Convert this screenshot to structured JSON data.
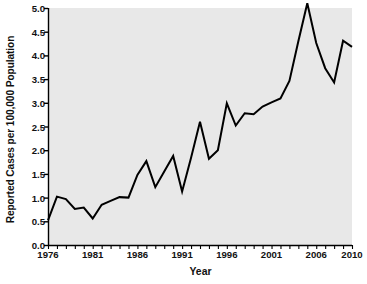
{
  "chart_data": {
    "type": "line",
    "title": "",
    "xlabel": "Year",
    "ylabel": "Reported Cases per 100,000 Population",
    "xlim": [
      1976,
      2010
    ],
    "ylim": [
      0.0,
      5.0
    ],
    "grid": false,
    "legend": null,
    "plot_background": "#e8e8e8",
    "line_color": "#000000",
    "axis_color": "#000000",
    "x": [
      1976,
      1977,
      1978,
      1979,
      1980,
      1981,
      1982,
      1983,
      1984,
      1985,
      1986,
      1987,
      1988,
      1989,
      1990,
      1991,
      1992,
      1993,
      1994,
      1995,
      1996,
      1997,
      1998,
      1999,
      2000,
      2001,
      2002,
      2003,
      2004,
      2005,
      2006,
      2007,
      2008,
      2009,
      2010
    ],
    "values": [
      0.52,
      1.02,
      0.97,
      0.76,
      0.79,
      0.56,
      0.85,
      0.93,
      1.01,
      1.0,
      1.48,
      1.77,
      1.22,
      1.55,
      1.88,
      1.13,
      1.84,
      2.6,
      1.82,
      2.0,
      2.99,
      2.52,
      2.78,
      2.76,
      2.92,
      3.01,
      3.09,
      3.46,
      4.3,
      5.1,
      4.26,
      3.73,
      3.43,
      4.31,
      4.18
    ],
    "ytick_values": [
      "0.0",
      "0.5",
      "1.0",
      "1.5",
      "2.0",
      "2.5",
      "3.0",
      "3.5",
      "4.0",
      "4.5",
      "5.0"
    ],
    "xtick_values": [
      "1976",
      "1981",
      "1986",
      "1991",
      "1996",
      "2001",
      "2006",
      "2010"
    ],
    "xtick_minor_every": 1
  }
}
